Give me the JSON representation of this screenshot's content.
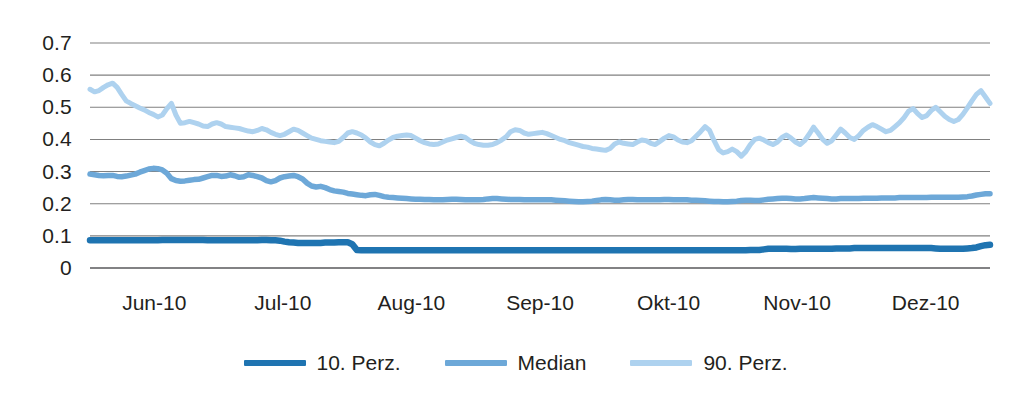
{
  "chart_data": {
    "type": "line",
    "title": "",
    "subtitle": "",
    "xlabel": "",
    "ylabel": "",
    "grid": true,
    "legend_position": "bottom",
    "ylim": [
      0,
      0.7
    ],
    "ytick_labels": [
      "0.7",
      "0.6",
      "0.5",
      "0.4",
      "0.3",
      "0.2",
      "0.1",
      "0"
    ],
    "ytick_values": [
      0.7,
      0.6,
      0.5,
      0.4,
      0.3,
      0.2,
      0.1,
      0
    ],
    "xtick_labels": [
      "Jun-10",
      "Jul-10",
      "Aug-10",
      "Sep-10",
      "Okt-10",
      "Nov-10",
      "Dez-10"
    ],
    "colors": {
      "p10": "#1f74b1",
      "median": "#6da8d8",
      "p90": "#aed2ef",
      "gridline": "#808080",
      "axis": "#58595b",
      "text": "#231f20",
      "background": "#ffffff"
    },
    "series": [
      {
        "name": "10. Perz.",
        "color": "#1f74b1",
        "values": [
          0.086,
          0.086,
          0.086,
          0.086,
          0.086,
          0.086,
          0.086,
          0.086,
          0.086,
          0.086,
          0.086,
          0.086,
          0.086,
          0.086,
          0.086,
          0.086,
          0.087,
          0.087,
          0.087,
          0.087,
          0.087,
          0.087,
          0.087,
          0.087,
          0.087,
          0.087,
          0.086,
          0.086,
          0.086,
          0.086,
          0.086,
          0.086,
          0.086,
          0.086,
          0.086,
          0.086,
          0.086,
          0.086,
          0.087,
          0.087,
          0.086,
          0.086,
          0.085,
          0.082,
          0.08,
          0.079,
          0.078,
          0.078,
          0.078,
          0.078,
          0.078,
          0.078,
          0.079,
          0.079,
          0.079,
          0.08,
          0.08,
          0.08,
          0.074,
          0.056,
          0.055,
          0.055,
          0.055,
          0.055,
          0.055,
          0.055,
          0.055,
          0.055,
          0.055,
          0.055,
          0.055,
          0.055,
          0.055,
          0.055,
          0.055,
          0.055,
          0.055,
          0.055,
          0.055,
          0.055,
          0.055,
          0.055,
          0.055,
          0.055,
          0.055,
          0.055,
          0.055,
          0.055,
          0.055,
          0.055,
          0.055,
          0.055,
          0.055,
          0.055,
          0.055,
          0.055,
          0.055,
          0.055,
          0.055,
          0.055,
          0.055,
          0.055,
          0.055,
          0.055,
          0.055,
          0.055,
          0.055,
          0.055,
          0.055,
          0.055,
          0.055,
          0.055,
          0.055,
          0.055,
          0.055,
          0.055,
          0.055,
          0.055,
          0.055,
          0.055,
          0.055,
          0.055,
          0.055,
          0.055,
          0.055,
          0.055,
          0.055,
          0.055,
          0.055,
          0.055,
          0.055,
          0.055,
          0.055,
          0.055,
          0.055,
          0.055,
          0.055,
          0.055,
          0.055,
          0.055,
          0.055,
          0.055,
          0.055,
          0.055,
          0.055,
          0.055,
          0.056,
          0.056,
          0.056,
          0.058,
          0.06,
          0.06,
          0.06,
          0.06,
          0.06,
          0.059,
          0.059,
          0.06,
          0.06,
          0.06,
          0.06,
          0.06,
          0.06,
          0.06,
          0.06,
          0.061,
          0.061,
          0.061,
          0.061,
          0.062,
          0.062,
          0.062,
          0.062,
          0.062,
          0.062,
          0.062,
          0.062,
          0.062,
          0.062,
          0.062,
          0.062,
          0.062,
          0.062,
          0.062,
          0.062,
          0.062,
          0.062,
          0.061,
          0.06,
          0.06,
          0.06,
          0.06,
          0.06,
          0.06,
          0.061,
          0.062,
          0.064,
          0.068,
          0.071,
          0.072
        ]
      },
      {
        "name": "Median",
        "color": "#6da8d8",
        "values": [
          0.292,
          0.29,
          0.288,
          0.287,
          0.288,
          0.288,
          0.285,
          0.284,
          0.286,
          0.289,
          0.292,
          0.298,
          0.303,
          0.308,
          0.31,
          0.309,
          0.305,
          0.295,
          0.278,
          0.272,
          0.27,
          0.271,
          0.273,
          0.275,
          0.276,
          0.28,
          0.284,
          0.288,
          0.288,
          0.285,
          0.286,
          0.29,
          0.287,
          0.282,
          0.284,
          0.29,
          0.288,
          0.284,
          0.28,
          0.272,
          0.268,
          0.272,
          0.28,
          0.284,
          0.286,
          0.288,
          0.284,
          0.277,
          0.264,
          0.255,
          0.252,
          0.254,
          0.25,
          0.244,
          0.24,
          0.238,
          0.236,
          0.232,
          0.23,
          0.228,
          0.226,
          0.225,
          0.228,
          0.229,
          0.226,
          0.222,
          0.22,
          0.219,
          0.218,
          0.217,
          0.216,
          0.215,
          0.214,
          0.214,
          0.213,
          0.213,
          0.212,
          0.212,
          0.212,
          0.213,
          0.214,
          0.214,
          0.213,
          0.212,
          0.212,
          0.212,
          0.212,
          0.213,
          0.215,
          0.216,
          0.216,
          0.215,
          0.214,
          0.213,
          0.213,
          0.213,
          0.212,
          0.212,
          0.212,
          0.212,
          0.212,
          0.212,
          0.212,
          0.211,
          0.21,
          0.209,
          0.208,
          0.207,
          0.206,
          0.206,
          0.207,
          0.208,
          0.21,
          0.212,
          0.213,
          0.212,
          0.211,
          0.211,
          0.212,
          0.213,
          0.213,
          0.212,
          0.212,
          0.212,
          0.212,
          0.212,
          0.212,
          0.213,
          0.213,
          0.212,
          0.212,
          0.212,
          0.212,
          0.211,
          0.211,
          0.21,
          0.209,
          0.208,
          0.207,
          0.207,
          0.206,
          0.206,
          0.207,
          0.208,
          0.21,
          0.211,
          0.211,
          0.21,
          0.21,
          0.212,
          0.214,
          0.215,
          0.216,
          0.217,
          0.217,
          0.216,
          0.215,
          0.215,
          0.216,
          0.218,
          0.219,
          0.218,
          0.217,
          0.216,
          0.215,
          0.215,
          0.216,
          0.216,
          0.216,
          0.216,
          0.216,
          0.217,
          0.217,
          0.217,
          0.217,
          0.218,
          0.218,
          0.218,
          0.218,
          0.219,
          0.219,
          0.219,
          0.219,
          0.219,
          0.219,
          0.219,
          0.22,
          0.22,
          0.22,
          0.22,
          0.22,
          0.22,
          0.22,
          0.221,
          0.222,
          0.224,
          0.227,
          0.229,
          0.231,
          0.231
        ]
      },
      {
        "name": "90. Perz.",
        "color": "#aed2ef",
        "values": [
          0.556,
          0.548,
          0.552,
          0.562,
          0.57,
          0.575,
          0.562,
          0.54,
          0.52,
          0.512,
          0.505,
          0.498,
          0.492,
          0.484,
          0.478,
          0.47,
          0.476,
          0.496,
          0.512,
          0.476,
          0.45,
          0.452,
          0.456,
          0.452,
          0.448,
          0.442,
          0.44,
          0.448,
          0.452,
          0.448,
          0.44,
          0.438,
          0.436,
          0.434,
          0.43,
          0.426,
          0.424,
          0.428,
          0.434,
          0.43,
          0.422,
          0.416,
          0.412,
          0.416,
          0.424,
          0.432,
          0.428,
          0.42,
          0.412,
          0.404,
          0.4,
          0.396,
          0.394,
          0.392,
          0.39,
          0.394,
          0.406,
          0.42,
          0.424,
          0.42,
          0.414,
          0.404,
          0.392,
          0.384,
          0.38,
          0.388,
          0.398,
          0.406,
          0.41,
          0.412,
          0.414,
          0.412,
          0.404,
          0.396,
          0.39,
          0.386,
          0.384,
          0.386,
          0.392,
          0.398,
          0.402,
          0.406,
          0.41,
          0.406,
          0.396,
          0.388,
          0.384,
          0.382,
          0.382,
          0.384,
          0.39,
          0.398,
          0.408,
          0.424,
          0.43,
          0.428,
          0.42,
          0.416,
          0.418,
          0.42,
          0.422,
          0.418,
          0.412,
          0.406,
          0.4,
          0.396,
          0.39,
          0.386,
          0.382,
          0.378,
          0.376,
          0.372,
          0.37,
          0.368,
          0.366,
          0.372,
          0.386,
          0.392,
          0.388,
          0.386,
          0.384,
          0.392,
          0.398,
          0.396,
          0.388,
          0.384,
          0.394,
          0.404,
          0.412,
          0.408,
          0.398,
          0.392,
          0.39,
          0.396,
          0.41,
          0.424,
          0.44,
          0.428,
          0.396,
          0.368,
          0.358,
          0.362,
          0.37,
          0.362,
          0.348,
          0.362,
          0.384,
          0.4,
          0.404,
          0.398,
          0.39,
          0.384,
          0.392,
          0.406,
          0.414,
          0.404,
          0.392,
          0.384,
          0.396,
          0.416,
          0.438,
          0.42,
          0.4,
          0.388,
          0.396,
          0.414,
          0.432,
          0.42,
          0.406,
          0.4,
          0.412,
          0.428,
          0.438,
          0.446,
          0.44,
          0.432,
          0.424,
          0.428,
          0.44,
          0.452,
          0.468,
          0.488,
          0.496,
          0.48,
          0.468,
          0.474,
          0.49,
          0.5,
          0.486,
          0.472,
          0.462,
          0.456,
          0.462,
          0.478,
          0.498,
          0.52,
          0.54,
          0.552,
          0.532,
          0.512
        ]
      }
    ]
  },
  "legend": {
    "items": [
      {
        "label": "10. Perz.",
        "color": "#1f74b1"
      },
      {
        "label": "Median",
        "color": "#6da8d8"
      },
      {
        "label": "90. Perz.",
        "color": "#aed2ef"
      }
    ]
  }
}
